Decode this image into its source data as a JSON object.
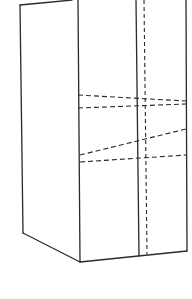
{
  "diagram": {
    "type": "line-drawing",
    "colors": {
      "background": "#ffffff",
      "stroke": "#2a2a2a"
    },
    "solid_edges": [
      {
        "name": "top-left-edge",
        "x1": 20,
        "y1": 5,
        "x2": 72,
        "y2": 0
      },
      {
        "name": "left-side-edge",
        "x1": 20,
        "y1": 5,
        "x2": 23,
        "y2": 233
      },
      {
        "name": "front-left-edge",
        "x1": 78,
        "y1": 0,
        "x2": 80,
        "y2": 262
      },
      {
        "name": "bottom-left-edge",
        "x1": 23,
        "y1": 233,
        "x2": 80,
        "y2": 262
      },
      {
        "name": "bottom-front-edge",
        "x1": 80,
        "y1": 262,
        "x2": 187,
        "y2": 251
      },
      {
        "name": "center-divider-edge",
        "x1": 136,
        "y1": 0,
        "x2": 139,
        "y2": 256
      },
      {
        "name": "right-edge",
        "x1": 186,
        "y1": 0,
        "x2": 187,
        "y2": 251
      }
    ],
    "dashed_lines": [
      {
        "name": "fold-line-1",
        "x1": 78,
        "y1": 95,
        "x2": 186,
        "y2": 101
      },
      {
        "name": "fold-line-2",
        "x1": 78,
        "y1": 108,
        "x2": 186,
        "y2": 104
      },
      {
        "name": "fold-line-3",
        "x1": 80,
        "y1": 155,
        "x2": 186,
        "y2": 129
      },
      {
        "name": "fold-line-4",
        "x1": 80,
        "y1": 162,
        "x2": 186,
        "y2": 155
      },
      {
        "name": "vertical-fold-line",
        "x1": 144,
        "y1": 0,
        "x2": 147,
        "y2": 254
      }
    ]
  }
}
